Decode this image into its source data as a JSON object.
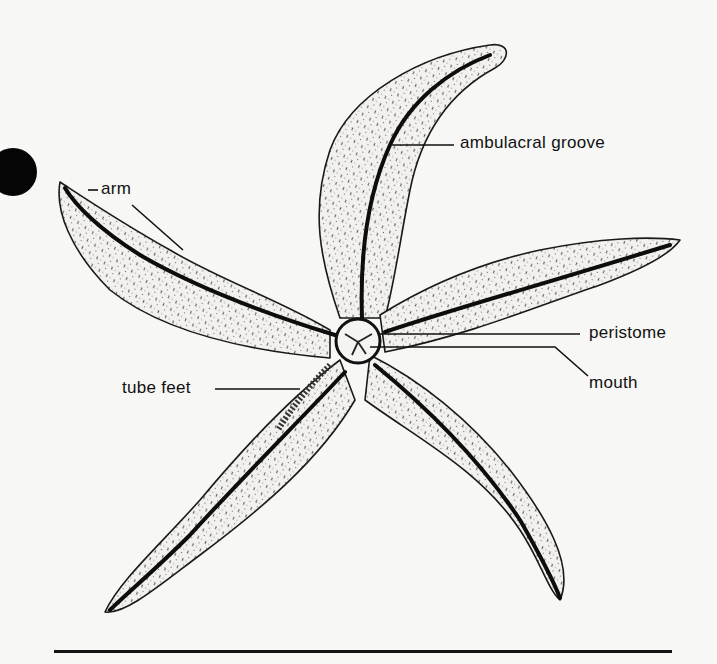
{
  "figure": {
    "labels": {
      "arm": "arm",
      "ambulacral_groove": "ambulacral groove",
      "peristome": "peristome",
      "mouth": "mouth",
      "tube_feet": "tube feet"
    }
  },
  "colors": {
    "background": "#f7f7f5",
    "ink": "#111111"
  }
}
